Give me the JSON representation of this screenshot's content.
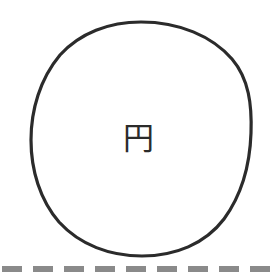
{
  "figure": {
    "background_color": "#ffffff",
    "width": 279,
    "height": 276,
    "shape": {
      "name": "circle",
      "label": "円",
      "label_reading": "en",
      "label_meaning": "circle",
      "stroke_color": "#2b2b2b",
      "stroke_width": 3,
      "fill_color": "#ffffff",
      "center_x": 141,
      "center_y": 139,
      "radius_x": 110,
      "radius_y": 117
    },
    "divider": {
      "name": "dashed-rule",
      "color": "#8a8a8a",
      "y": 266,
      "thickness": 6,
      "dash_length": 20,
      "gap_length": 11,
      "dash_count": 9
    }
  }
}
